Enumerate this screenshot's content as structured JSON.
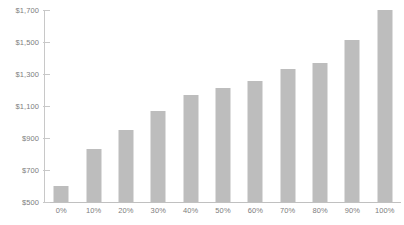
{
  "chart_data": {
    "type": "bar",
    "title": "",
    "xlabel": "",
    "ylabel": "",
    "categories": [
      "0%",
      "10%",
      "20%",
      "30%",
      "40%",
      "50%",
      "60%",
      "70%",
      "80%",
      "90%",
      "100%"
    ],
    "values": [
      600,
      830,
      950,
      1070,
      1170,
      1215,
      1255,
      1330,
      1370,
      1515,
      1700
    ],
    "ylim": [
      500,
      1700
    ],
    "yticks": [
      500,
      700,
      900,
      1100,
      1300,
      1500,
      1700
    ],
    "ytick_labels": [
      "$500",
      "$700",
      "$900",
      "$1,100",
      "$1,300",
      "$1,500",
      "$1,700"
    ],
    "grid": false,
    "legend": null,
    "bar_color": "#bdbdbd",
    "axis_color": "#c8c8c8",
    "label_color": "#7d7d7d"
  },
  "caption": {
    "text": ""
  }
}
